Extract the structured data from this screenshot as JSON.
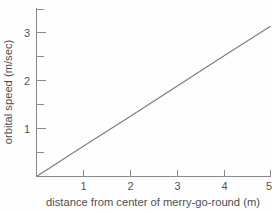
{
  "chart_data": {
    "type": "line",
    "title": "",
    "subtitle": "",
    "xlabel": "distance from center of merry-go-round (m)",
    "ylabel": "orbital speed (m/sec)",
    "xlim": [
      0,
      5.0
    ],
    "ylim": [
      0,
      3.45
    ],
    "grid": false,
    "legend": null,
    "x_ticks_major": [
      1,
      2,
      3,
      4,
      5
    ],
    "x_tick_labels": [
      "1",
      "2",
      "3",
      "4",
      "5"
    ],
    "y_ticks_major": [
      1,
      2,
      3
    ],
    "y_tick_labels": [
      "1",
      "2",
      "3"
    ],
    "y_ticks_minor": [
      0.5,
      1.5,
      2.5,
      3.0,
      3.5
    ],
    "series": [
      {
        "name": "orbital speed vs distance",
        "slope": 0.627,
        "intercept": 0,
        "x": [
          0,
          1,
          2,
          3,
          4,
          5
        ],
        "values": [
          0,
          0.63,
          1.25,
          1.88,
          2.51,
          3.13
        ],
        "color": "#7d7d7d"
      }
    ],
    "annotations": []
  },
  "figure": {
    "background_color": "#fefefe",
    "axis_color": "#8a8a8a",
    "text_color": "#4f4f4f"
  }
}
